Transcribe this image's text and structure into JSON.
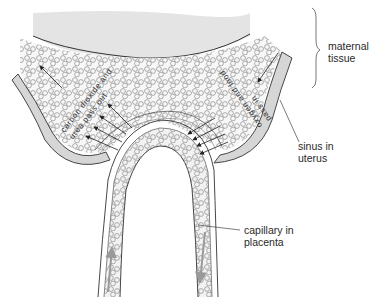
{
  "diagram": {
    "colors": {
      "maternal_tissue_fill": "#e4e4e4",
      "sinus_wall_fill": "#d6d6d6",
      "blood_area_fill": "#f7f7f7",
      "outline": "#3a3a3a",
      "cell_outline": "#8a8a8a",
      "flow_arrow": "#9a9a9a"
    },
    "labels": {
      "maternal_tissue": [
        "maternal",
        "tissue"
      ],
      "sinus_in_uterus": [
        "sinus in",
        "uterus"
      ],
      "capillary_in_placenta": [
        "capillary in",
        "placenta"
      ]
    },
    "annotations": {
      "left": [
        "carbon dioxide and",
        "urea pass out"
      ],
      "right": [
        "oxygen and food",
        "pass in"
      ]
    }
  }
}
